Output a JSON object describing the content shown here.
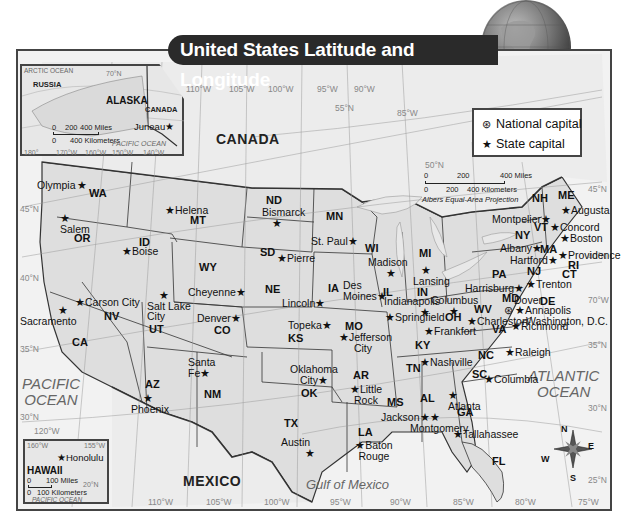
{
  "title": "United States Latitude and Longitude",
  "legend": {
    "items": [
      {
        "symbol": "⊛",
        "icon": "national-capital-icon",
        "label": "National capital"
      },
      {
        "symbol": "★",
        "icon": "state-capital-icon",
        "label": "State capital"
      }
    ]
  },
  "scale_main": {
    "miles_ticks": [
      "0",
      "200",
      "400 Miles"
    ],
    "km_ticks": [
      "0",
      "200",
      "400 Kilometers"
    ],
    "projection": "Albers Equal-Area Projection"
  },
  "countries": {
    "canada": "CANADA",
    "mexico": "MEXICO",
    "russia": "RUSSIA"
  },
  "oceans": {
    "pacific": "PACIFIC\nOCEAN",
    "atlantic": "ATLANTIC\nOCEAN",
    "gulf": "Gulf of Mexico"
  },
  "lakes": [
    "Lake Superior",
    "Lake Michigan",
    "Lake Huron",
    "Lake Erie",
    "Lake Ontario"
  ],
  "grid_labels": {
    "top_longitudes": [
      "110°W",
      "105°W",
      "100°W",
      "95°W",
      "90°W",
      "85°W"
    ],
    "bottom_longitudes": [
      "110°W",
      "105°W",
      "100°W",
      "95°W",
      "90°W",
      "85°W",
      "80°W",
      "75°W"
    ],
    "latitudes_left": [
      "45°N",
      "40°N",
      "35°N",
      "30°N"
    ],
    "latitudes_right": [
      "45°N",
      "40°N",
      "35°N",
      "30°N",
      "25°N"
    ],
    "other": [
      "55°N",
      "50°N",
      "70°W",
      "120°W"
    ]
  },
  "alaska_inset": {
    "state": "ALASKA",
    "neighbors": [
      "RUSSIA",
      "CANADA"
    ],
    "ocean_top": "ARCTIC OCEAN",
    "ocean_bottom": "PACIFIC OCEAN",
    "capital": "Juneau",
    "lat_label": "70°N",
    "longitudes": [
      "180°",
      "170°W",
      "160°W",
      "150°W",
      "140°W"
    ],
    "scale_miles": [
      "0",
      "200",
      "400 Miles"
    ],
    "scale_km": [
      "0",
      "400 Kilometers"
    ]
  },
  "hawaii_inset": {
    "state": "HAWAII",
    "capital": "Honolulu",
    "longitudes": [
      "160°W",
      "155°W"
    ],
    "lat_label": "20°N",
    "scale_miles": "100 Miles",
    "scale_km": "100 Kilometers",
    "scale_zero": "0",
    "ocean": "PACIFIC OCEAN"
  },
  "states": [
    {
      "abbr": "WA",
      "capital": "Olympia"
    },
    {
      "abbr": "OR",
      "capital": "Salem"
    },
    {
      "abbr": "CA",
      "capital": "Sacramento"
    },
    {
      "abbr": "NV",
      "capital": "Carson City"
    },
    {
      "abbr": "ID",
      "capital": "Boise"
    },
    {
      "abbr": "MT",
      "capital": "Helena"
    },
    {
      "abbr": "WY",
      "capital": "Cheyenne"
    },
    {
      "abbr": "UT",
      "capital": "Salt Lake City"
    },
    {
      "abbr": "CO",
      "capital": "Denver"
    },
    {
      "abbr": "AZ",
      "capital": "Phoenix"
    },
    {
      "abbr": "NM",
      "capital": "Santa Fe"
    },
    {
      "abbr": "ND",
      "capital": "Bismarck"
    },
    {
      "abbr": "SD",
      "capital": "Pierre"
    },
    {
      "abbr": "NE",
      "capital": "Lincoln"
    },
    {
      "abbr": "KS",
      "capital": "Topeka"
    },
    {
      "abbr": "OK",
      "capital": "Oklahoma City"
    },
    {
      "abbr": "TX",
      "capital": "Austin"
    },
    {
      "abbr": "MN",
      "capital": "St. Paul"
    },
    {
      "abbr": "IA",
      "capital": "Des Moines"
    },
    {
      "abbr": "MO",
      "capital": "Jefferson City"
    },
    {
      "abbr": "AR",
      "capital": "Little Rock"
    },
    {
      "abbr": "LA",
      "capital": "Baton Rouge"
    },
    {
      "abbr": "WI",
      "capital": "Madison"
    },
    {
      "abbr": "IL",
      "capital": "Springfield"
    },
    {
      "abbr": "MS",
      "capital": "Jackson"
    },
    {
      "abbr": "MI",
      "capital": "Lansing"
    },
    {
      "abbr": "IN",
      "capital": "Indianapolis"
    },
    {
      "abbr": "KY",
      "capital": "Frankfort"
    },
    {
      "abbr": "TN",
      "capital": "Nashville"
    },
    {
      "abbr": "AL",
      "capital": "Montgomery"
    },
    {
      "abbr": "OH",
      "capital": "Columbus"
    },
    {
      "abbr": "GA",
      "capital": "Atlanta"
    },
    {
      "abbr": "FL",
      "capital": "Tallahassee"
    },
    {
      "abbr": "SC",
      "capital": "Columbia"
    },
    {
      "abbr": "NC",
      "capital": "Raleigh"
    },
    {
      "abbr": "VA",
      "capital": "Richmond"
    },
    {
      "abbr": "WV",
      "capital": "Charleston"
    },
    {
      "abbr": "PA",
      "capital": "Harrisburg"
    },
    {
      "abbr": "MD",
      "capital": "Annapolis"
    },
    {
      "abbr": "DE",
      "capital": "Dover"
    },
    {
      "abbr": "NJ",
      "capital": "Trenton"
    },
    {
      "abbr": "NY",
      "capital": "Albany"
    },
    {
      "abbr": "CT",
      "capital": "Hartford"
    },
    {
      "abbr": "RI",
      "capital": "Providence"
    },
    {
      "abbr": "MA",
      "capital": "Boston"
    },
    {
      "abbr": "VT",
      "capital": "Montpelier"
    },
    {
      "abbr": "NH",
      "capital": "Concord"
    },
    {
      "abbr": "ME",
      "capital": "Augusta"
    }
  ],
  "national_capital": "Washington, D.C.",
  "compass": {
    "n": "N",
    "e": "E",
    "s": "S",
    "w": "W"
  }
}
